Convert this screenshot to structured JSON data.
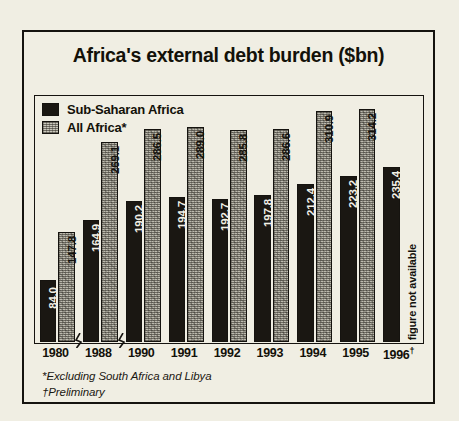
{
  "chart": {
    "title": "Africa's external debt burden ($bn)",
    "footnotes": [
      "*Excluding South Africa and Libya",
      "†Preliminary"
    ],
    "missing_note": "figure not available",
    "legend": [
      {
        "label": "Sub-Saharan Africa",
        "swatch": "dark-swatch-icon"
      },
      {
        "label": "All Africa*",
        "swatch": "light-swatch-icon"
      }
    ]
  },
  "chart_data": {
    "type": "bar",
    "title": "Africa's external debt burden ($bn)",
    "xlabel": "",
    "ylabel": "$bn",
    "ylim": [
      0,
      330
    ],
    "grid": false,
    "legend_position": "top-left",
    "axis_breaks_after": [
      "1980",
      "1988"
    ],
    "categories": [
      "1980",
      "1988",
      "1990",
      "1991",
      "1992",
      "1993",
      "1994",
      "1995",
      "1996†"
    ],
    "series": [
      {
        "name": "Sub-Saharan Africa",
        "values": [
          84.0,
          164.9,
          190.2,
          194.7,
          192.7,
          197.8,
          212.4,
          223.2,
          235.4
        ],
        "labels": [
          "84.0",
          "164.9",
          "190.2",
          "194.7",
          "192.7",
          "197.8",
          "212.4",
          "223.2",
          "235.4"
        ],
        "color": "#1a1712"
      },
      {
        "name": "All Africa*",
        "values": [
          147.8,
          269.1,
          286.5,
          289.0,
          285.8,
          286.6,
          310.9,
          314.2,
          null
        ],
        "labels": [
          "147.8",
          "269.1",
          "286.5",
          "289.0",
          "285.8",
          "286.6",
          "310.9",
          "314.2",
          "figure not available"
        ],
        "color": "#bcbaae"
      }
    ]
  },
  "xticks": [
    {
      "year": "1980",
      "dagger": ""
    },
    {
      "year": "1988",
      "dagger": ""
    },
    {
      "year": "1990",
      "dagger": ""
    },
    {
      "year": "1991",
      "dagger": ""
    },
    {
      "year": "1992",
      "dagger": ""
    },
    {
      "year": "1993",
      "dagger": ""
    },
    {
      "year": "1994",
      "dagger": ""
    },
    {
      "year": "1995",
      "dagger": ""
    },
    {
      "year": "1996",
      "dagger": "†"
    }
  ],
  "colors": {
    "background": "#f0eee3",
    "ink": "#15130f",
    "dark_bar": "#1a1712",
    "light_bar": "#bcbaae"
  }
}
